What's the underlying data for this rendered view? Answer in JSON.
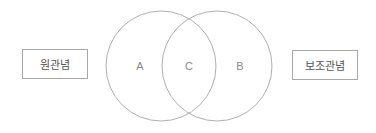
{
  "diagram": {
    "type": "venn",
    "left_box": {
      "label": "원관념"
    },
    "right_box": {
      "label": "보조관념"
    },
    "circles": [
      {
        "id": "left",
        "region_label": "A",
        "cx": 161,
        "cy": 66,
        "r": 55
      },
      {
        "id": "right",
        "region_label": "B",
        "cx": 217,
        "cy": 66,
        "r": 55
      }
    ],
    "intersection_label": "C",
    "colors": {
      "stroke": "#b0b0b0",
      "text": "#8a8a8a",
      "box_border": "#a8a8a8"
    }
  }
}
